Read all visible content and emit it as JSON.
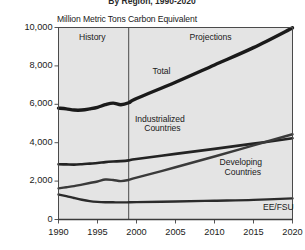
{
  "chart_data": {
    "type": "line",
    "title": "By Region, 1990-2020",
    "subtitle": "",
    "xlabel": "",
    "ylabel": "Million Metric Tons Carbon Equivalent",
    "xlim": [
      1990,
      2020
    ],
    "ylim": [
      0,
      10000
    ],
    "xticks": [
      1990,
      1995,
      2000,
      2005,
      2010,
      2015,
      2020
    ],
    "xticklabels": [
      "1990",
      "1995",
      "2000",
      "2005",
      "2010",
      "2015",
      "2020"
    ],
    "yticks": [
      0,
      2000,
      4000,
      6000,
      8000,
      10000
    ],
    "yticklabels": [
      "0",
      "2,000",
      "4,000",
      "6,000",
      "8,000",
      "10,000"
    ],
    "grid": false,
    "legend_position": "inline-annotations",
    "history_projection_divider": 1999,
    "x": [
      1990,
      1991,
      1992,
      1993,
      1994,
      1995,
      1996,
      1997,
      1998,
      1999,
      2000,
      2005,
      2010,
      2015,
      2020
    ],
    "series": [
      {
        "name": "Total",
        "color": "#1a1a1a",
        "width": 3.4,
        "values": [
          5800,
          5760,
          5700,
          5700,
          5760,
          5840,
          5980,
          6060,
          5980,
          6080,
          6300,
          7150,
          8050,
          8950,
          9980
        ]
      },
      {
        "name": "Industrialized Countries",
        "color": "#232323",
        "width": 2.6,
        "values": [
          2880,
          2870,
          2860,
          2880,
          2910,
          2940,
          2990,
          3020,
          3040,
          3080,
          3150,
          3420,
          3680,
          3950,
          4230
        ]
      },
      {
        "name": "Developing Countries",
        "color": "#3a3a3a",
        "width": 2.4,
        "values": [
          1620,
          1680,
          1740,
          1820,
          1900,
          1980,
          2080,
          2060,
          2000,
          2060,
          2180,
          2720,
          3280,
          3860,
          4440
        ]
      },
      {
        "name": "EE/FSU",
        "color": "#2b2b2b",
        "width": 2.4,
        "values": [
          1300,
          1220,
          1120,
          1030,
          960,
          920,
          900,
          895,
          890,
          895,
          905,
          940,
          980,
          1020,
          1100
        ]
      }
    ],
    "annotations": [
      {
        "text": "History",
        "x": 1994.3,
        "y": 9450
      },
      {
        "text": "Projections",
        "x": 2009.5,
        "y": 9450
      },
      {
        "text": "Total",
        "x": 2003.2,
        "y": 7680
      },
      {
        "text": "Industrialized",
        "x": 2003.0,
        "y": 5180
      },
      {
        "text": "Countries",
        "x": 2003.3,
        "y": 4700
      },
      {
        "text": "Developing",
        "x": 2013.4,
        "y": 2920
      },
      {
        "text": "Countries",
        "x": 2013.6,
        "y": 2440
      },
      {
        "text": "EE/FSU",
        "x": 2018.2,
        "y": 620
      }
    ],
    "colors": {
      "plot_background": "#e4e4e4",
      "page_background": "#ffffff",
      "axis": "#555555",
      "text": "#1a1a1a"
    }
  }
}
